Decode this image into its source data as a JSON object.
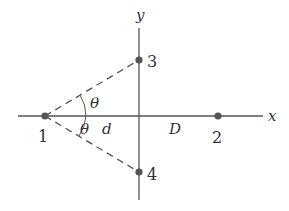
{
  "diagram": {
    "axes": {
      "x_label": "x",
      "y_label": "y"
    },
    "points": [
      {
        "id": "1",
        "label": "1",
        "cx": 45,
        "cy": 116
      },
      {
        "id": "2",
        "label": "2",
        "cx": 218,
        "cy": 116
      },
      {
        "id": "3",
        "label": "3",
        "cx": 139,
        "cy": 60
      },
      {
        "id": "4",
        "label": "4",
        "cx": 139,
        "cy": 172
      }
    ],
    "angles": [
      {
        "label": "θ",
        "position": "upper"
      },
      {
        "label": "θ",
        "position": "lower"
      }
    ],
    "distances": {
      "d_label": "d",
      "D_label": "D"
    },
    "colors": {
      "line": "#555555",
      "point": "#555555",
      "text": "#333333"
    }
  }
}
